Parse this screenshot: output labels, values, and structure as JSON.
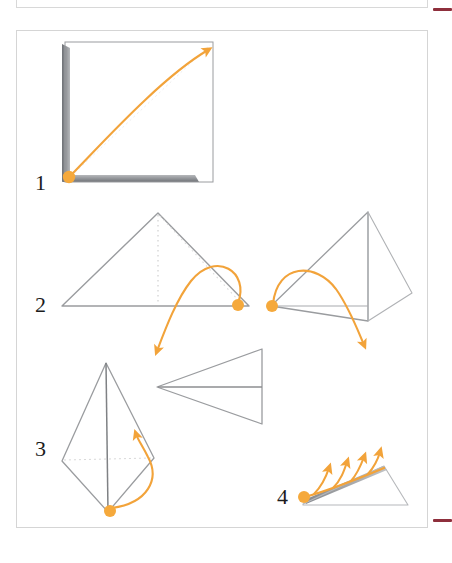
{
  "document": {
    "kind": "origami-folding-instructions",
    "width": 452,
    "height": 563,
    "background_color": "#ffffff"
  },
  "colors": {
    "accent_orange": "#f5a93c",
    "arrow_orange": "#f2a33a",
    "paper_edge": "#8c8c8c",
    "paper_edge_dark": "#6f7277",
    "fold_dotted": "#c9c9c9",
    "panel_border": "#d5d5d5",
    "rule_mark": "#8e2f3c",
    "label_text": "#1c1c1c"
  },
  "panels": {
    "above": {
      "name": "previous-figure-panel",
      "visible_edges": "bottom-and-sides"
    },
    "main": {
      "name": "instruction-figure-panel"
    }
  },
  "rule_marks": [
    {
      "name": "top-rule-mark",
      "position": "top-right"
    },
    {
      "name": "bottom-rule-mark",
      "position": "bottom-right"
    }
  ],
  "steps": [
    {
      "number": "1",
      "label": "1",
      "shape": "square-sheet",
      "description": "Square sheet of paper with shaded left and bottom edges; drag corner upward to the right.",
      "grab_point": {
        "x": 69,
        "y": 177
      },
      "arrow": {
        "type": "curved-arrow",
        "from": [
          69,
          177
        ],
        "to": [
          212,
          46
        ]
      }
    },
    {
      "number": "2",
      "label": "2",
      "shape": "folded-triangle",
      "description": "Triangle with dotted fold lines; drag the right corner down and across, then the resulting flap down to the right.",
      "grab_points": [
        {
          "x": 238,
          "y": 305
        },
        {
          "x": 272,
          "y": 306
        }
      ],
      "arrows": [
        {
          "type": "curved-arrow",
          "from": [
            238,
            305
          ],
          "to": [
            157,
            357
          ]
        },
        {
          "type": "curved-arrow",
          "from": [
            272,
            306
          ],
          "to": [
            366,
            351
          ]
        }
      ]
    },
    {
      "number": "3",
      "label": "3",
      "shape": "kite-body",
      "description": "Kite-shaped body with centre crease; lift the bottom point up along the right side to form the wing. Result is the side view of a paper plane.",
      "grab_point": {
        "x": 110,
        "y": 510
      },
      "arrow": {
        "type": "curved-arrow",
        "from": [
          110,
          510
        ],
        "to": [
          137,
          436
        ]
      },
      "result_shape": "paper-plane-side-view"
    },
    {
      "number": "4",
      "label": "4",
      "shape": "flattened-plane",
      "description": "Finished paper plane seen from the side; fan of arrows shows the wing being flared upward.",
      "grab_point": {
        "x": 304,
        "y": 495
      },
      "arrows_count": 4,
      "arrows": [
        {
          "type": "straight-arrow",
          "to": [
            330,
            466
          ]
        },
        {
          "type": "straight-arrow",
          "to": [
            347,
            461
          ]
        },
        {
          "type": "straight-arrow",
          "to": [
            363,
            457
          ]
        },
        {
          "type": "straight-arrow",
          "to": [
            379,
            453
          ]
        }
      ]
    }
  ]
}
